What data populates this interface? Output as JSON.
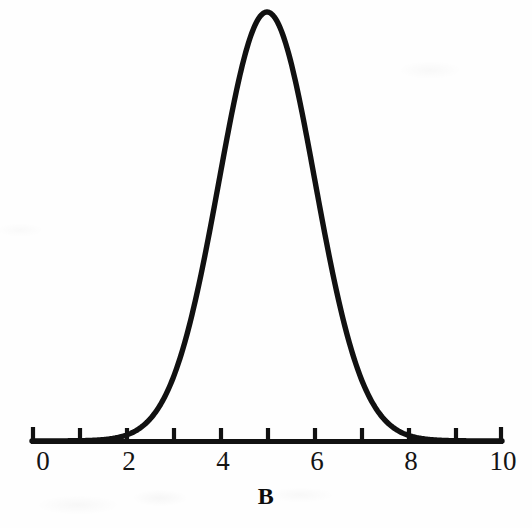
{
  "chart_data": {
    "type": "line",
    "title": "",
    "subtitle": "",
    "xlabel": "B",
    "ylabel": "",
    "xlim": [
      0,
      10
    ],
    "ylim": [
      0,
      1
    ],
    "grid": false,
    "legend_position": "none",
    "xtick_labels": [
      "0",
      "2",
      "4",
      "6",
      "8",
      "10"
    ],
    "xticks_major": [
      0,
      2,
      4,
      6,
      8,
      10
    ],
    "xticks_all": [
      0,
      1,
      2,
      3,
      4,
      5,
      6,
      7,
      8,
      9,
      10
    ],
    "ytick_labels": [],
    "annotations": [],
    "curve": {
      "name": "normal-density",
      "distribution": "normal",
      "mean": 5,
      "sigma": 1.02,
      "peak_x": 5,
      "peak_y": 1,
      "color": "#111111",
      "line_width_px": 5.4
    },
    "x": [
      0,
      0.25,
      0.5,
      0.75,
      1,
      1.25,
      1.5,
      1.75,
      2,
      2.25,
      2.5,
      2.75,
      3,
      3.25,
      3.5,
      3.75,
      4,
      4.25,
      4.5,
      4.75,
      5,
      5.25,
      5.5,
      5.75,
      6,
      6.25,
      6.5,
      6.75,
      7,
      7.25,
      7.5,
      7.75,
      8,
      8.25,
      8.5,
      8.75,
      9,
      9.25,
      9.5,
      9.75,
      10
    ],
    "series": [
      {
        "name": "Distribution B",
        "values": [
          0.0,
          0.0,
          0.0,
          0.001,
          0.002,
          0.005,
          0.011,
          0.024,
          0.047,
          0.085,
          0.144,
          0.228,
          0.337,
          0.465,
          0.6,
          0.727,
          0.826,
          0.911,
          0.964,
          0.991,
          1.0,
          0.991,
          0.964,
          0.911,
          0.826,
          0.727,
          0.6,
          0.465,
          0.337,
          0.228,
          0.144,
          0.085,
          0.047,
          0.024,
          0.011,
          0.005,
          0.002,
          0.001,
          0.0,
          0.0,
          0.0
        ]
      }
    ]
  },
  "axis": {
    "title": "B",
    "tick_labels": [
      {
        "value": "0",
        "x": 0
      },
      {
        "value": "2",
        "x": 2
      },
      {
        "value": "4",
        "x": 4
      },
      {
        "value": "6",
        "x": 6
      },
      {
        "value": "8",
        "x": 8
      },
      {
        "value": "10",
        "x": 10
      }
    ],
    "axis_color": "#111111",
    "label_color": "#141414"
  },
  "figure": {
    "background_color": "#fefefe",
    "ink_color": "#111111"
  }
}
